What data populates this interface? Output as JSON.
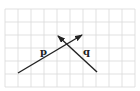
{
  "diagram": {
    "type": "grid-with-vectors",
    "grid": {
      "x0": 5,
      "y0": 9,
      "spacing": 13,
      "cols": 10,
      "rows": 6,
      "line_color": "#d9d9d9"
    },
    "vectors": [
      {
        "name": "p",
        "label": "p",
        "from": [
          18,
          73
        ],
        "to": [
          82,
          35
        ],
        "color": "#222222",
        "label_pos": [
          40,
          55
        ]
      },
      {
        "name": "q",
        "label": "q",
        "from": [
          97,
          72
        ],
        "to": [
          58,
          36
        ],
        "color": "#222222",
        "label_pos": [
          83,
          55
        ]
      }
    ]
  }
}
